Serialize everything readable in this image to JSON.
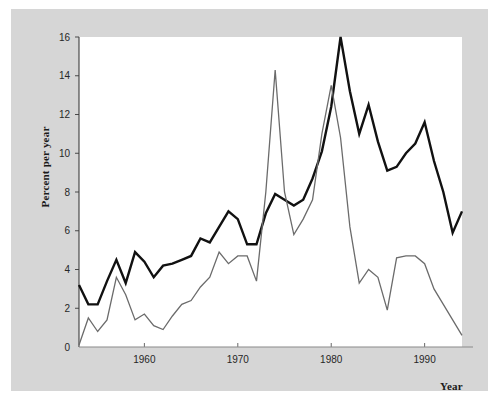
{
  "figure": {
    "background_color": "#ffffff",
    "panel_color": "#d6d6d6",
    "plot_color": "#ffffff"
  },
  "axes": {
    "ylabel": "Percent per year",
    "xlabel": "Year"
  },
  "annotations": {
    "nominal": "NOMINAL\nINTEREST\nRATE",
    "inflation": "INFLATION\nRATE"
  },
  "chart_data": {
    "type": "line",
    "title": "",
    "xlabel": "Year",
    "ylabel": "Percent per year",
    "xlim": [
      1953,
      1994
    ],
    "ylim": [
      0,
      16
    ],
    "xticks": [
      1960,
      1970,
      1980,
      1990
    ],
    "xtick_labels": [
      "1960",
      "1970",
      "1980",
      "1990"
    ],
    "yticks": [
      0,
      2,
      4,
      6,
      8,
      10,
      12,
      14,
      16
    ],
    "ytick_labels": [
      "0",
      "2",
      "4",
      "6",
      "8",
      "10",
      "12",
      "14",
      "16"
    ],
    "grid": false,
    "legend_position": "inline-annotation",
    "x": [
      1953,
      1954,
      1955,
      1956,
      1957,
      1958,
      1959,
      1960,
      1961,
      1962,
      1963,
      1964,
      1965,
      1966,
      1967,
      1968,
      1969,
      1970,
      1971,
      1972,
      1973,
      1974,
      1975,
      1976,
      1977,
      1978,
      1979,
      1980,
      1981,
      1982,
      1983,
      1984,
      1985,
      1986,
      1987,
      1988,
      1989,
      1990,
      1991,
      1992,
      1993,
      1994
    ],
    "series": [
      {
        "name": "NOMINAL INTEREST RATE",
        "color": "#111111",
        "width": 2.4,
        "values": [
          3.2,
          2.2,
          2.2,
          3.4,
          4.5,
          3.3,
          4.9,
          4.4,
          3.6,
          4.2,
          4.3,
          4.5,
          4.7,
          5.6,
          5.4,
          6.2,
          7.0,
          6.6,
          5.3,
          5.3,
          6.9,
          7.9,
          7.6,
          7.3,
          7.6,
          8.7,
          10.1,
          12.4,
          16.0,
          13.2,
          11.0,
          12.5,
          10.6,
          9.1,
          9.3,
          10.0,
          10.5,
          11.6,
          9.6,
          8.0,
          5.9,
          7.0
        ]
      },
      {
        "name": "INFLATION RATE",
        "color": "#6b6b6b",
        "width": 1.3,
        "values": [
          0.1,
          1.5,
          0.8,
          1.4,
          3.6,
          2.7,
          1.4,
          1.7,
          1.1,
          0.9,
          1.6,
          2.2,
          2.4,
          3.1,
          3.6,
          4.9,
          4.3,
          4.7,
          4.7,
          3.4,
          8.0,
          14.3,
          8.0,
          5.8,
          6.6,
          7.6,
          11.0,
          13.5,
          10.8,
          6.2,
          3.3,
          4.0,
          3.6,
          1.9,
          4.6,
          4.7,
          4.7,
          4.3,
          3.0,
          2.2,
          1.4,
          0.6
        ]
      }
    ]
  }
}
